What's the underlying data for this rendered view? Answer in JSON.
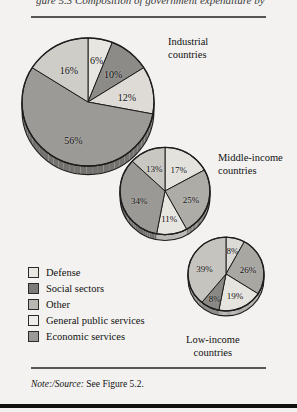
{
  "figure": {
    "cropped_header_text": "gure 5.3  Composition of government expenditure by category",
    "note_label": "Note:/Source:",
    "note_text": " See Figure 5.2."
  },
  "legend": {
    "items": [
      {
        "label": "Defense",
        "color": "#e8e6e1"
      },
      {
        "label": "Social sectors",
        "color": "#7d7b78"
      },
      {
        "label": "Other",
        "color": "#b9b7b2"
      },
      {
        "label": "General public services",
        "color": "#efedea"
      },
      {
        "label": "Economic services",
        "color": "#9c9a96"
      }
    ]
  },
  "chart_data": [
    {
      "type": "pie",
      "title": "Industrial countries",
      "caption_lines": [
        "Industrial",
        "countries"
      ],
      "categories": [
        "Defense",
        "Other",
        "General public services",
        "Social sectors",
        "Economic services"
      ],
      "values": [
        6,
        10,
        12,
        56,
        16
      ],
      "labels": [
        "6%",
        "10%",
        "12%",
        "56%",
        "16%"
      ],
      "colors": [
        "#e8e6e1",
        "#8d8b87",
        "#dedbd6",
        "#9c9a96",
        "#cfcdc8"
      ],
      "start_angle": 0,
      "radius": 66
    },
    {
      "type": "pie",
      "title": "Middle-income countries",
      "caption_lines": [
        "Middle-income",
        "countries"
      ],
      "categories": [
        "Defense",
        "Other",
        "General public services",
        "Social sectors",
        "Economic services"
      ],
      "values": [
        17,
        25,
        11,
        34,
        13
      ],
      "labels": [
        "17%",
        "25%",
        "11%",
        "34%",
        "13%"
      ],
      "colors": [
        "#e4e2dd",
        "#aeaca7",
        "#e8e6e1",
        "#9b9995",
        "#c9c7c2"
      ],
      "start_angle": 0,
      "radius": 45
    },
    {
      "type": "pie",
      "title": "Low-income countries",
      "caption_lines": [
        "Low-income",
        "countries"
      ],
      "categories": [
        "Defense",
        "Other",
        "General public services",
        "Social sectors",
        "Economic services"
      ],
      "values": [
        8,
        26,
        19,
        8,
        39
      ],
      "labels": [
        "8%",
        "26%",
        "19%",
        "8%",
        "39%"
      ],
      "colors": [
        "#dcdad5",
        "#a9a7a2",
        "#e6e4df",
        "#8a8884",
        "#c6c4bf"
      ],
      "start_angle": 0,
      "radius": 38
    }
  ]
}
